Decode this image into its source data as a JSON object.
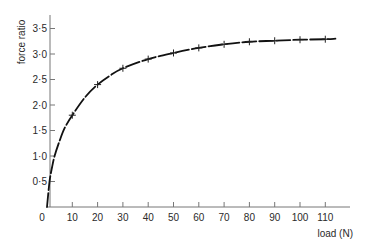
{
  "chart_data": {
    "type": "line",
    "title": "",
    "xlabel": "load (N)",
    "ylabel": "force ratio",
    "xlim": [
      0,
      118
    ],
    "ylim": [
      0,
      3.75
    ],
    "grid": false,
    "legend": null,
    "x_ticks": [
      0,
      10,
      20,
      30,
      40,
      50,
      60,
      70,
      80,
      90,
      100,
      110
    ],
    "x_tick_labels": [
      "0",
      "10",
      "20",
      "30",
      "40",
      "50",
      "60",
      "70",
      "80",
      "90",
      "100",
      "110"
    ],
    "y_ticks": [
      0.5,
      1.0,
      1.5,
      2.0,
      2.5,
      3.0,
      3.5
    ],
    "y_tick_labels": [
      "0·5",
      "1·0",
      "1·5",
      "2·0",
      "2·5",
      "3·0",
      "3·5"
    ],
    "series": [
      {
        "name": "measured",
        "marker": "+",
        "x": [
          10,
          20,
          30,
          40,
          50,
          60,
          70,
          80,
          90,
          100,
          110
        ],
        "values": [
          1.8,
          2.4,
          2.72,
          2.9,
          3.02,
          3.12,
          3.19,
          3.24,
          3.26,
          3.28,
          3.29
        ]
      },
      {
        "name": "fitted curve",
        "marker": "none",
        "x": [
          0,
          1,
          2,
          3,
          5,
          7,
          10,
          15,
          20,
          25,
          30,
          40,
          50,
          60,
          70,
          80,
          90,
          100,
          110,
          114
        ],
        "values": [
          0,
          0.5,
          0.78,
          1.0,
          1.3,
          1.55,
          1.8,
          2.15,
          2.4,
          2.58,
          2.72,
          2.9,
          3.02,
          3.12,
          3.19,
          3.24,
          3.26,
          3.28,
          3.29,
          3.3
        ]
      }
    ]
  }
}
